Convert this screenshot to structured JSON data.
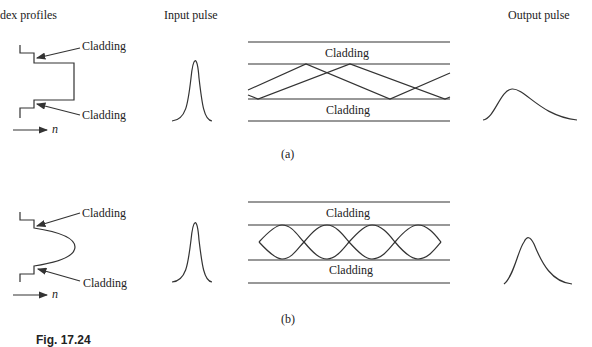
{
  "headers": {
    "index_profiles": "dex profiles",
    "input_pulse": "Input pulse",
    "output_pulse": "Output pulse"
  },
  "panel_a": {
    "label": "(a)",
    "profile_type": "step-index",
    "cladding_top_label": "Cladding",
    "cladding_bottom_label": "Cladding",
    "n_label": "n",
    "waveguide_top_label": "Cladding",
    "waveguide_bottom_label": "Cladding"
  },
  "panel_b": {
    "label": "(b)",
    "profile_type": "graded-index",
    "cladding_top_label": "Cladding",
    "cladding_bottom_label": "Cladding",
    "n_label": "n",
    "waveguide_top_label": "Cladding",
    "waveguide_bottom_label": "Cladding"
  },
  "caption": "Fig. 17.24",
  "colors": {
    "stroke": "#333333",
    "background": "#ffffff"
  }
}
